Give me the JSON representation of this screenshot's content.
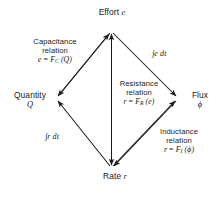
{
  "diagram": {
    "stroke_color": "#1a1a1a",
    "background_color": "#ffffff",
    "vertices": {
      "top": {
        "name": "Effort",
        "symbol": "e"
      },
      "left": {
        "name": "Quantity",
        "symbol": "Q"
      },
      "right": {
        "name": "Flux",
        "symbol": "ϕ"
      },
      "bottom": {
        "name": "Rate",
        "symbol": "r"
      }
    },
    "relations": {
      "capacitance": {
        "line1": "Capacitance",
        "line2": "relation",
        "formula_lhs": "e",
        "formula_eq": " = ",
        "formula_fn": "F",
        "formula_sub": "C",
        "formula_arg": " (Q)"
      },
      "resistance": {
        "line1": "Resistance",
        "line2": "relation",
        "formula_lhs": "r",
        "formula_eq": " = ",
        "formula_fn": "F",
        "formula_sub": "R",
        "formula_arg": " (e)"
      },
      "inductance": {
        "line1": "Inductance",
        "line2": "relation",
        "formula_lhs": "r",
        "formula_eq": " =  ",
        "formula_fn": "F",
        "formula_sub": "I",
        "formula_arg": " (ϕ)"
      }
    },
    "integrals": {
      "effort_to_flux": "∫e dt",
      "rate_to_quantity": "∫r dt"
    },
    "edges": [
      {
        "id": "quantity-to-effort",
        "from": "Quantity",
        "to": "Effort",
        "label": "Capacitance relation",
        "arrow": "single"
      },
      {
        "id": "effort-to-flux",
        "from": "Effort",
        "to": "Flux",
        "label": "∫e dt",
        "arrow": "single"
      },
      {
        "id": "flux-to-rate",
        "from": "Flux",
        "to": "Rate",
        "label": "Inductance relation",
        "arrow": "single"
      },
      {
        "id": "rate-to-quantity",
        "from": "Rate",
        "to": "Quantity",
        "label": "∫r dt",
        "arrow": "single"
      },
      {
        "id": "effort-rate-axis",
        "from": "Effort",
        "to": "Rate",
        "label": "Resistance relation",
        "arrow": "double"
      }
    ]
  }
}
